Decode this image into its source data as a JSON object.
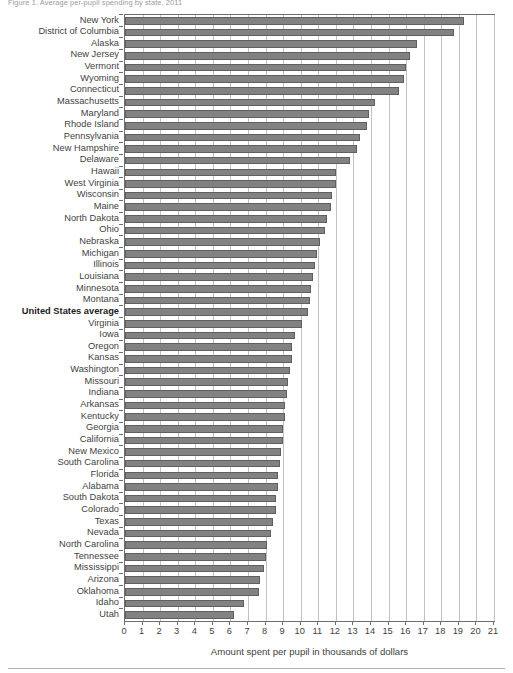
{
  "figure": {
    "title": "Figure 1. Average per-pupil spending by state, 2011",
    "x_axis_title": "Amount spent per pupil in thousands of dollars"
  },
  "chart_data": {
    "type": "bar",
    "orientation": "horizontal",
    "title": "Figure 1. Average per-pupil spending by state, 2011",
    "xlabel": "Amount spent per pupil in thousands of dollars",
    "ylabel": "",
    "xlim": [
      0,
      21
    ],
    "xticks": [
      0,
      1,
      2,
      3,
      4,
      5,
      6,
      7,
      8,
      9,
      10,
      11,
      12,
      13,
      14,
      15,
      16,
      17,
      18,
      19,
      20,
      21
    ],
    "grid": true,
    "grid_axis": "x",
    "legend": false,
    "bar_color": "#828282",
    "bar_edge_color": "#5f5f5f",
    "emphasis_category": "United States average",
    "categories": [
      "New York",
      "District of Columbia",
      "Alaska",
      "New Jersey",
      "Vermont",
      "Wyoming",
      "Connecticut",
      "Massachusetts",
      "Maryland",
      "Rhode Island",
      "Pennsylvania",
      "New Hampshire",
      "Delaware",
      "Hawaii",
      "West Virginia",
      "Wisconsin",
      "Maine",
      "North Dakota",
      "Ohio",
      "Nebraska",
      "Michigan",
      "Illinois",
      "Louisiana",
      "Minnesota",
      "Montana",
      "United States average",
      "Virginia",
      "Iowa",
      "Oregon",
      "Kansas",
      "Washington",
      "Missouri",
      "Indiana",
      "Arkansas",
      "Kentucky",
      "Georgia",
      "California",
      "New Mexico",
      "South Carolina",
      "Florida",
      "Alabama",
      "South Dakota",
      "Colorado",
      "Texas",
      "Nevada",
      "North Carolina",
      "Tennessee",
      "Mississippi",
      "Arizona",
      "Oklahoma",
      "Idaho",
      "Utah"
    ],
    "values": [
      19.3,
      18.7,
      16.6,
      16.2,
      16.0,
      15.9,
      15.6,
      14.2,
      13.9,
      13.8,
      13.4,
      13.2,
      12.8,
      12.0,
      12.0,
      11.8,
      11.7,
      11.5,
      11.4,
      11.1,
      10.9,
      10.8,
      10.7,
      10.6,
      10.5,
      10.4,
      10.1,
      9.7,
      9.5,
      9.5,
      9.4,
      9.3,
      9.2,
      9.1,
      9.1,
      9.0,
      9.0,
      8.9,
      8.8,
      8.7,
      8.7,
      8.6,
      8.6,
      8.4,
      8.3,
      8.1,
      8.0,
      7.9,
      7.7,
      7.6,
      6.8,
      6.2
    ]
  }
}
